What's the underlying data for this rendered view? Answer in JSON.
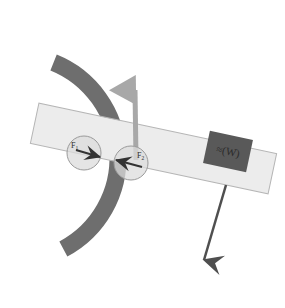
{
  "figure": {
    "background_color": "#ffffff",
    "width": 285,
    "height": 308
  },
  "arc": {
    "name": "curved-wall-arc",
    "color": "#6e6e6e",
    "stroke_width": 17,
    "center_x": 15,
    "center_y": 158,
    "radius": 103,
    "start_angle_deg": -68,
    "end_angle_deg": 62
  },
  "beam": {
    "name": "inclined-beam",
    "fill_color": "#ececec",
    "border_color": "#b5b5b5",
    "rotation_deg": 12,
    "x": 32,
    "y": 128,
    "width": 243,
    "height": 41
  },
  "contact_forces": [
    {
      "id": "left-contact-force",
      "label": "F",
      "subscript": "1",
      "circle_cx": 84,
      "circle_cy": 153,
      "circle_r": 17,
      "circle_fill": "#dcdcdc",
      "circle_stroke": "#9a9a9a",
      "arrow_color": "#333333",
      "arrow_x1": 76,
      "arrow_y1": 150,
      "arrow_x2": 100,
      "arrow_y2": 157,
      "label_x": 71,
      "label_y": 148,
      "direction": "right"
    },
    {
      "id": "right-contact-force",
      "label": "F",
      "subscript": "2",
      "circle_cx": 131,
      "circle_cy": 163,
      "circle_r": 17,
      "circle_fill": "#dcdcdc",
      "circle_stroke": "#9a9a9a",
      "arrow_color": "#333333",
      "arrow_x1": 142,
      "arrow_y1": 167,
      "arrow_x2": 116,
      "arrow_y2": 160,
      "label_x": 137,
      "label_y": 158,
      "direction": "left"
    }
  ],
  "normal_force_arrow": {
    "name": "normal-force-arrow",
    "color": "#a8a8a8",
    "stroke_width": 5,
    "x1": 136,
    "y1": 160,
    "x2": 135,
    "y2": 90,
    "head_size": 7,
    "label": ""
  },
  "weight_arrow": {
    "name": "weight-force-arrow",
    "color": "#4f4f4f",
    "stroke_width": 2.5,
    "x1": 226,
    "y1": 185,
    "x2": 204,
    "y2": 260,
    "head_size": 7,
    "label": ""
  },
  "weight_block": {
    "name": "weight-block",
    "label": "(W)",
    "prefix_symbol": "≈",
    "fill_color": "#595959",
    "text_color": "#111111",
    "x": 206,
    "y": 135,
    "width": 44,
    "height": 33,
    "rotation_deg": 12,
    "font_size": 11
  },
  "colors": {
    "arc": "#6e6e6e",
    "beam_fill": "#ececec",
    "beam_border": "#b5b5b5",
    "block": "#595959",
    "up_arrow": "#a8a8a8",
    "down_arrow": "#4f4f4f",
    "circle_fill": "#dcdcdc",
    "circle_stroke": "#9a9a9a"
  }
}
